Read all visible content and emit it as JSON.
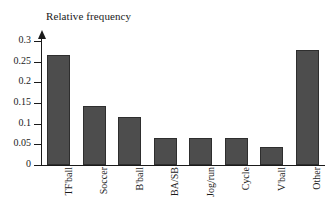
{
  "chart_data": {
    "type": "bar",
    "title": "Relative frequency",
    "xlabel": "",
    "ylabel": "Relative frequency",
    "categories": [
      "TF'ball",
      "Soccer",
      "B'ball",
      "BA/SB",
      "Jog/run",
      "Cycle",
      "V'ball",
      "Other"
    ],
    "values": [
      0.265,
      0.143,
      0.115,
      0.066,
      0.066,
      0.066,
      0.044,
      0.279
    ],
    "ylim": [
      0,
      0.3
    ],
    "yticks": [
      0,
      0.05,
      0.1,
      0.15,
      0.2,
      0.25,
      0.3
    ],
    "ytick_labels": [
      "0",
      "0.05",
      "0.1",
      "0.15",
      "0.2",
      "0.25",
      "0.3"
    ],
    "grid": false,
    "legend": false,
    "legend_position": "none",
    "bar_color": "#4d4d4d",
    "bar_edge_color": "#2e2e2e",
    "axis_color": "#1a1a1a",
    "background_color": "#ffffff",
    "xtick_rotation": 90,
    "yaxis_arrow": true
  }
}
